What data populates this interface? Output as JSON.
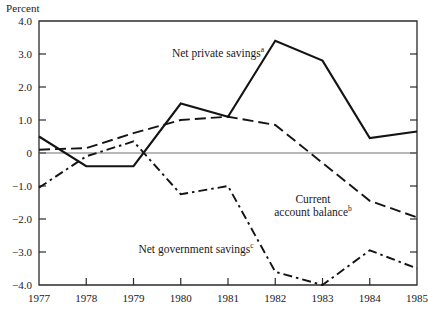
{
  "chart_data": {
    "type": "line",
    "title": "",
    "xlabel": "",
    "ylabel": "Percent",
    "ylim": [
      -4.0,
      4.0
    ],
    "xlim": [
      1977,
      1985
    ],
    "grid": false,
    "zero_line": true,
    "legend_position": "inline-annotations",
    "categories": [
      1977,
      1978,
      1979,
      1980,
      1981,
      1982,
      1983,
      1984,
      1985
    ],
    "x_tick_labels": [
      "1977",
      "1978",
      "1979",
      "1980",
      "1981",
      "1982",
      "1983",
      "1984",
      "1985"
    ],
    "y_tick_labels": [
      "4.0",
      "3.0",
      "2.0",
      "1.0",
      "0",
      "−1.0",
      "−2.0",
      "−3.0",
      "−4.0"
    ],
    "y_tick_values": [
      4.0,
      3.0,
      2.0,
      1.0,
      0,
      -1.0,
      -2.0,
      -3.0,
      -4.0
    ],
    "series": [
      {
        "name": "Net private savings",
        "footnote": "a",
        "style": "solid",
        "color": "#141414",
        "values": [
          0.5,
          -0.4,
          -0.4,
          1.5,
          1.1,
          3.4,
          2.8,
          0.45,
          0.65
        ]
      },
      {
        "name": "Current account balance",
        "footnote": "b",
        "style": "dashed",
        "color": "#141414",
        "values": [
          0.1,
          0.15,
          0.6,
          1.0,
          1.1,
          0.85,
          -0.3,
          -1.45,
          -1.95
        ]
      },
      {
        "name": "Net government savings",
        "footnote": "c",
        "style": "dash-dot",
        "color": "#141414",
        "values": [
          -1.05,
          -0.1,
          0.35,
          -1.25,
          -1.0,
          -3.6,
          -4.0,
          -2.95,
          -3.5
        ]
      }
    ],
    "annotations": [
      {
        "id": "net-private-savings",
        "text": "Net private savings",
        "footnote": "a",
        "x_px": 218,
        "y_px": 47
      },
      {
        "id": "current-account-balance",
        "line1": "Current",
        "line2": "account balance",
        "footnote": "b",
        "x_px": 313,
        "y_px": 193
      },
      {
        "id": "net-government-savings",
        "text": "Net government savings",
        "footnote": "c",
        "x_px": 196,
        "y_px": 243
      }
    ]
  }
}
